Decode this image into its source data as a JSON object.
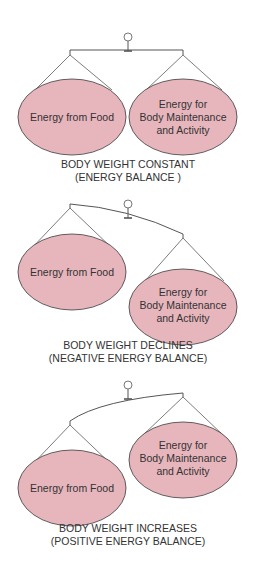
{
  "colors": {
    "pan_fill": "#e7b6bd",
    "stroke": "#3a3a3a",
    "text": "#333333"
  },
  "panels": [
    {
      "state": "balanced",
      "left_pan": [
        "Energy from Food"
      ],
      "right_pan": [
        "Energy for",
        "Body Maintenance",
        "and Activity"
      ],
      "caption": [
        "BODY WEIGHT CONSTANT",
        "(ENERGY BALANCE )"
      ]
    },
    {
      "state": "right-heavy",
      "left_pan": [
        "Energy from Food"
      ],
      "right_pan": [
        "Energy for",
        "Body Maintenance",
        "and Activity"
      ],
      "caption": [
        "BODY WEIGHT DECLINES",
        "(NEGATIVE ENERGY BALANCE)"
      ]
    },
    {
      "state": "left-heavy",
      "left_pan": [
        "Energy from Food"
      ],
      "right_pan": [
        "Energy for",
        "Body Maintenance",
        "and Activity"
      ],
      "caption": [
        "BODY WEIGHT INCREASES",
        "(POSITIVE ENERGY BALANCE)"
      ]
    }
  ]
}
